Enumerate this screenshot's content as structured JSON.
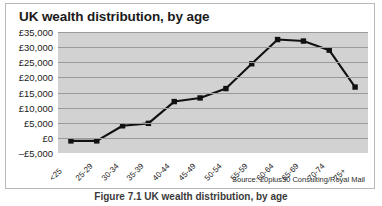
{
  "chart_data": {
    "type": "line",
    "title": "UK wealth distribution, by age",
    "xlabel": "",
    "ylabel": "",
    "categories": [
      "<25",
      "25-29",
      "30-34",
      "35-39",
      "40-44",
      "45-49",
      "50-54",
      "55-59",
      "60-64",
      "65-69",
      "70-74",
      "75+"
    ],
    "values": [
      -1000,
      -1000,
      4000,
      4800,
      12000,
      13200,
      16300,
      24500,
      32500,
      32000,
      29000,
      16800
    ],
    "series": [
      {
        "name": "UK wealth distribution",
        "values": [
          -1000,
          -1000,
          4000,
          4800,
          12000,
          13200,
          16300,
          24500,
          32500,
          32000,
          29000,
          16800
        ]
      }
    ],
    "ylim": [
      -5000,
      35000
    ],
    "ytick_values": [
      35000,
      30000,
      25000,
      20000,
      15000,
      10000,
      5000,
      0,
      -5000
    ],
    "ytick_labels": [
      "£35,000",
      "£30,000",
      "£25,000",
      "£20,000",
      "£15,000",
      "£10,000",
      "£5,000",
      "£0",
      "–£5,000"
    ],
    "grid": true,
    "legend": "none",
    "marker": "square",
    "line_color": "#111111",
    "marker_color": "#111111",
    "plot_background": "#d2d2d2",
    "gridline_color": "#9a9a9a",
    "annotations": [
      {
        "text": "Source: 20plus30 Consulting/Royal Mail",
        "position": "bottom-right"
      }
    ]
  },
  "source_note": "Source: 20plus30 Consulting/Royal Mail",
  "caption": "Figure 7.1  UK wealth distribution, by age"
}
